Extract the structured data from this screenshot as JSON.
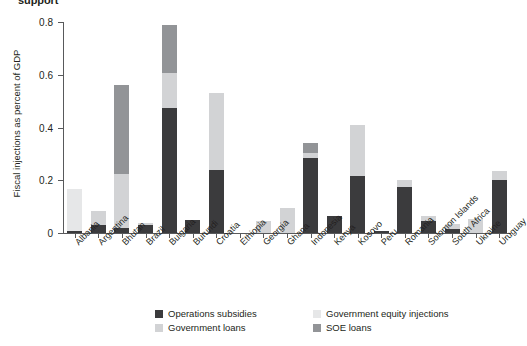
{
  "title": "support",
  "axis": {
    "ylabel": "Fiscal injections as percent of GDP",
    "yticks": [
      "0",
      "0.2",
      "0.4",
      "0.6",
      "0.8"
    ],
    "ytick_values": [
      0,
      0.2,
      0.4,
      0.6,
      0.8
    ],
    "ymin": 0,
    "ymax": 0.8
  },
  "colors": {
    "operations_subsidies": "#3b3b3d",
    "government_loans": "#d2d3d5",
    "government_equity_injections": "#e6e7e8",
    "soe_loans": "#929497"
  },
  "legend": {
    "items": [
      {
        "label": "Operations subsidies",
        "color": "#3b3b3d",
        "key": "operations_subsidies"
      },
      {
        "label": "Government equity injections",
        "color": "#e6e7e8",
        "key": "government_equity_injections"
      },
      {
        "label": "Government loans",
        "color": "#d2d3d5",
        "key": "government_loans"
      },
      {
        "label": "SOE loans",
        "color": "#929497",
        "key": "soe_loans"
      }
    ]
  },
  "chart_data": {
    "type": "bar",
    "subtype": "stacked",
    "title": "support",
    "xlabel": "",
    "ylabel": "Fiscal injections as percent of GDP",
    "ylim": [
      0,
      0.8
    ],
    "grid": false,
    "legend_position": "bottom",
    "categories": [
      "Albania",
      "Argentina",
      "Bhutan",
      "Brazil",
      "Bulgaria",
      "Burundi",
      "Croatia",
      "Ethiopia",
      "Georgia",
      "Ghana",
      "Indonesia",
      "Kenya",
      "Kosovo",
      "Peru",
      "Romania",
      "Solomon Islands",
      "South Africa",
      "Ukraine",
      "Uruguay"
    ],
    "series": [
      {
        "name": "Operations subsidies",
        "color": "#3b3b3d",
        "values": [
          0.008,
          0.03,
          0.02,
          0.03,
          0.475,
          0.05,
          0.24,
          0,
          0,
          0,
          0.285,
          0.065,
          0.215,
          0.008,
          0.175,
          0.045,
          0.015,
          0,
          0.2
        ]
      },
      {
        "name": "Government loans",
        "color": "#d2d3d5",
        "values": [
          0,
          0.055,
          0.205,
          0.008,
          0.13,
          0,
          0.29,
          0,
          0.045,
          0.095,
          0.02,
          0,
          0.195,
          0,
          0.025,
          0.02,
          0.02,
          0.055,
          0.035
        ]
      },
      {
        "name": "Government equity injections",
        "color": "#e6e7e8",
        "values": [
          0.157,
          0,
          0,
          0,
          0,
          0,
          0,
          0,
          0,
          0,
          0,
          0,
          0,
          0,
          0,
          0,
          0,
          0,
          0
        ]
      },
      {
        "name": "SOE loans",
        "color": "#929497",
        "values": [
          0,
          0,
          0.335,
          0,
          0.185,
          0,
          0,
          0,
          0,
          0,
          0.035,
          0,
          0,
          0,
          0,
          0,
          0,
          0,
          0
        ]
      }
    ],
    "totals": [
      0.165,
      0.085,
      0.56,
      0.038,
      0.79,
      0.05,
      0.53,
      0,
      0.045,
      0.095,
      0.34,
      0.065,
      0.41,
      0.008,
      0.2,
      0.065,
      0.035,
      0.055,
      0.235
    ]
  }
}
